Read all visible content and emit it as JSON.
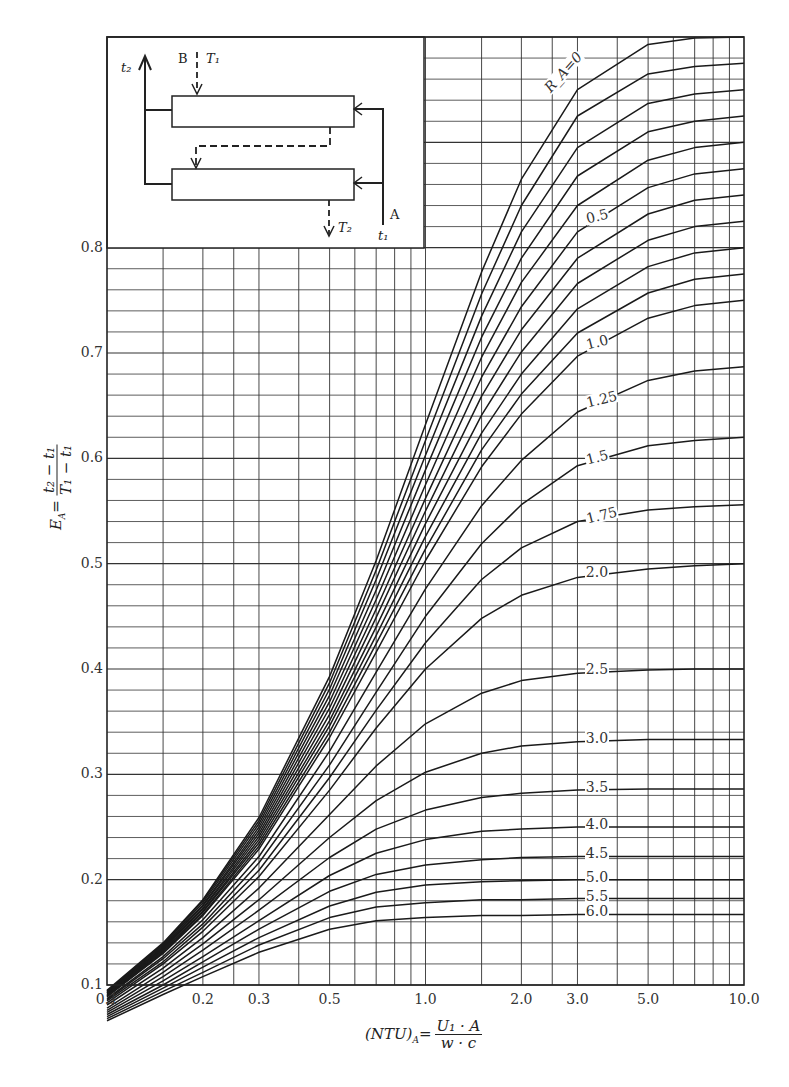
{
  "chart_data": {
    "type": "line",
    "title": "",
    "xlabel": "(NTU)_A = U1·A / (w·c)",
    "ylabel": "E_A = (t2 − t1) / (T1 − t1)",
    "xscale": "log",
    "xlim": [
      0.1,
      10.0
    ],
    "ylim": [
      0.1,
      1.0
    ],
    "grid": true,
    "x_tick_labels": [
      "0.1",
      "0.2",
      "0.3",
      "0.5",
      "1.0",
      "2.0",
      "3.0",
      "5.0",
      "10.0"
    ],
    "y_tick_labels": [
      "0.1",
      "0.2",
      "0.3",
      "0.4",
      "0.5",
      "0.6",
      "0.7",
      "0.8"
    ],
    "x": [
      0.1,
      0.15,
      0.2,
      0.3,
      0.5,
      0.7,
      1.0,
      1.5,
      2.0,
      3.0,
      5.0,
      7.0,
      10.0
    ],
    "series": [
      {
        "name": "R_A=0",
        "label": "R_A=0",
        "values": [
          0.095,
          0.14,
          0.181,
          0.259,
          0.393,
          0.503,
          0.632,
          0.777,
          0.865,
          0.95,
          0.993,
          0.999,
          1.0
        ]
      },
      {
        "name": "0.1",
        "label": "",
        "values": [
          0.094,
          0.139,
          0.18,
          0.256,
          0.387,
          0.494,
          0.617,
          0.756,
          0.84,
          0.925,
          0.965,
          0.972,
          0.975
        ]
      },
      {
        "name": "0.2",
        "label": "",
        "values": [
          0.094,
          0.138,
          0.178,
          0.253,
          0.381,
          0.485,
          0.603,
          0.735,
          0.815,
          0.895,
          0.937,
          0.946,
          0.95
        ]
      },
      {
        "name": "0.3",
        "label": "",
        "values": [
          0.093,
          0.137,
          0.176,
          0.25,
          0.375,
          0.475,
          0.589,
          0.715,
          0.79,
          0.868,
          0.91,
          0.92,
          0.925
        ]
      },
      {
        "name": "0.4",
        "label": "",
        "values": [
          0.092,
          0.136,
          0.175,
          0.247,
          0.369,
          0.466,
          0.575,
          0.696,
          0.767,
          0.84,
          0.883,
          0.895,
          0.9
        ]
      },
      {
        "name": "0.5",
        "label": "0.5",
        "values": [
          0.092,
          0.135,
          0.173,
          0.244,
          0.363,
          0.457,
          0.562,
          0.677,
          0.744,
          0.815,
          0.857,
          0.87,
          0.875
        ]
      },
      {
        "name": "0.6",
        "label": "",
        "values": [
          0.091,
          0.134,
          0.172,
          0.241,
          0.357,
          0.449,
          0.55,
          0.659,
          0.722,
          0.79,
          0.832,
          0.845,
          0.85
        ]
      },
      {
        "name": "0.7",
        "label": "",
        "values": [
          0.09,
          0.133,
          0.17,
          0.238,
          0.351,
          0.44,
          0.538,
          0.641,
          0.701,
          0.766,
          0.807,
          0.82,
          0.825
        ]
      },
      {
        "name": "0.8",
        "label": "",
        "values": [
          0.09,
          0.132,
          0.169,
          0.235,
          0.346,
          0.432,
          0.526,
          0.624,
          0.68,
          0.742,
          0.782,
          0.795,
          0.8
        ]
      },
      {
        "name": "0.9",
        "label": "",
        "values": [
          0.089,
          0.131,
          0.167,
          0.232,
          0.34,
          0.424,
          0.514,
          0.608,
          0.661,
          0.719,
          0.757,
          0.77,
          0.775
        ]
      },
      {
        "name": "1.0",
        "label": "1.0",
        "values": [
          0.089,
          0.13,
          0.166,
          0.229,
          0.335,
          0.416,
          0.503,
          0.592,
          0.642,
          0.697,
          0.733,
          0.745,
          0.75
        ]
      },
      {
        "name": "1.25",
        "label": "1.25",
        "values": [
          0.087,
          0.127,
          0.162,
          0.222,
          0.322,
          0.397,
          0.476,
          0.555,
          0.598,
          0.644,
          0.674,
          0.683,
          0.687
        ]
      },
      {
        "name": "1.5",
        "label": "1.5",
        "values": [
          0.086,
          0.125,
          0.158,
          0.216,
          0.309,
          0.378,
          0.45,
          0.519,
          0.556,
          0.593,
          0.612,
          0.617,
          0.62
        ]
      },
      {
        "name": "1.75",
        "label": "1.75",
        "values": [
          0.085,
          0.122,
          0.155,
          0.209,
          0.297,
          0.361,
          0.425,
          0.485,
          0.515,
          0.54,
          0.551,
          0.554,
          0.556
        ]
      },
      {
        "name": "2.0",
        "label": "2.0",
        "values": [
          0.083,
          0.12,
          0.151,
          0.203,
          0.285,
          0.344,
          0.4,
          0.448,
          0.47,
          0.487,
          0.495,
          0.498,
          0.5
        ]
      },
      {
        "name": "2.5",
        "label": "2.5",
        "values": [
          0.081,
          0.116,
          0.145,
          0.192,
          0.262,
          0.308,
          0.348,
          0.377,
          0.389,
          0.396,
          0.399,
          0.4,
          0.4
        ]
      },
      {
        "name": "3.0",
        "label": "3.0",
        "values": [
          0.078,
          0.112,
          0.139,
          0.181,
          0.24,
          0.275,
          0.302,
          0.32,
          0.327,
          0.331,
          0.333,
          0.333,
          0.333
        ]
      },
      {
        "name": "3.5",
        "label": "3.5",
        "values": [
          0.076,
          0.108,
          0.133,
          0.171,
          0.221,
          0.248,
          0.266,
          0.278,
          0.282,
          0.285,
          0.286,
          0.286,
          0.286
        ]
      },
      {
        "name": "4.0",
        "label": "4.0",
        "values": [
          0.074,
          0.104,
          0.127,
          0.161,
          0.204,
          0.225,
          0.238,
          0.246,
          0.248,
          0.25,
          0.25,
          0.25,
          0.25
        ]
      },
      {
        "name": "4.5",
        "label": "4.5",
        "values": [
          0.072,
          0.1,
          0.122,
          0.153,
          0.189,
          0.205,
          0.214,
          0.219,
          0.221,
          0.222,
          0.222,
          0.222,
          0.222
        ]
      },
      {
        "name": "5.0",
        "label": "5.0",
        "values": [
          0.07,
          0.097,
          0.117,
          0.145,
          0.175,
          0.188,
          0.195,
          0.198,
          0.199,
          0.2,
          0.2,
          0.2,
          0.2
        ]
      },
      {
        "name": "5.5",
        "label": "5.5",
        "values": [
          0.068,
          0.094,
          0.112,
          0.138,
          0.164,
          0.174,
          0.178,
          0.181,
          0.181,
          0.182,
          0.182,
          0.182,
          0.182
        ]
      },
      {
        "name": "6.0",
        "label": "6.0",
        "values": [
          0.066,
          0.091,
          0.108,
          0.131,
          0.153,
          0.161,
          0.164,
          0.166,
          0.166,
          0.167,
          0.167,
          0.167,
          0.167
        ]
      }
    ],
    "annotations": [
      "R_A=0",
      "0.5",
      "1.0",
      "1.25",
      "1.5",
      "1.75",
      "2.0",
      "2.5",
      "3.0",
      "3.5",
      "4.0",
      "4.5",
      "5.0",
      "5.5",
      "6.0"
    ]
  },
  "axes": {
    "ylabel_lhs": "E",
    "ylabel_sub": "A",
    "ylabel_num": "t₂ − t₁",
    "ylabel_den": "T₁ − t₁",
    "xlabel_lhs": "(NTU)",
    "xlabel_sub": "A",
    "xlabel_num": "U₁ · A",
    "xlabel_den": "w  ·  c"
  },
  "inset": {
    "label_t2": "t₂",
    "label_B": "B",
    "label_T1": "T₁",
    "label_T2": "T₂",
    "label_A": "A",
    "label_t1": "t₁"
  }
}
